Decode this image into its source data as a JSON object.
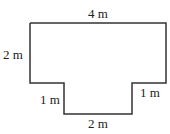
{
  "diagram": {
    "type": "composite-rectangle-shape",
    "labels": {
      "top": "4 m",
      "left": "2 m",
      "left_step": "1 m",
      "right_step": "1 m",
      "bottom": "2 m"
    },
    "stroke_color": "#333333"
  }
}
